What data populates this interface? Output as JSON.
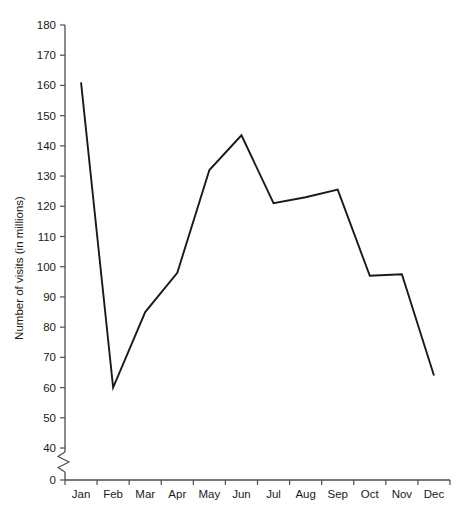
{
  "chart_data": {
    "type": "line",
    "title": "",
    "xlabel": "",
    "ylabel": "Number of visits (in millions)",
    "categories": [
      "Jan",
      "Feb",
      "Mar",
      "Apr",
      "May",
      "Jun",
      "Jul",
      "Aug",
      "Sep",
      "Oct",
      "Nov",
      "Dec"
    ],
    "values": [
      161,
      60,
      85,
      98,
      132,
      143.5,
      121,
      123,
      125.5,
      97,
      97.5,
      64
    ],
    "series": [
      {
        "name": "Number of visits",
        "values": [
          161,
          60,
          85,
          98,
          132,
          143.5,
          121,
          123,
          125.5,
          97,
          97.5,
          64
        ]
      }
    ],
    "ylim": [
      0,
      180
    ],
    "ytick_labels": [
      "0",
      "40",
      "50",
      "60",
      "70",
      "80",
      "90",
      "100",
      "110",
      "120",
      "130",
      "140",
      "150",
      "160",
      "170",
      "180"
    ],
    "ytick_values": [
      0,
      40,
      50,
      60,
      70,
      80,
      90,
      100,
      110,
      120,
      130,
      140,
      150,
      160,
      170,
      180
    ],
    "y_axis_break": true,
    "y_axis_break_between": [
      0,
      40
    ],
    "grid": false,
    "legend": "none",
    "line_color": "#1a1a1a",
    "axis_color": "#4d4d4d",
    "background_color": "#ffffff",
    "markers": "none"
  }
}
